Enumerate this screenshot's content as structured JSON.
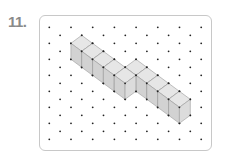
{
  "exercise": {
    "number_label": "11."
  },
  "diagram": {
    "type": "isometric-dot-paper",
    "grid": {
      "origin_x": 49.3,
      "origin_y": 27.3,
      "col_spacing": 10.85,
      "row_spacing": 16,
      "columns": 15,
      "rows": 8
    },
    "cube": {
      "edge_dx": 10.85,
      "edge_dy": 8,
      "height": 16
    },
    "segments": [
      {
        "name": "lower-row",
        "count": 5,
        "start_top": [
          81.7,
          35.3
        ]
      },
      {
        "name": "upper-row",
        "count": 5,
        "start_top": [
          136,
          59.3
        ]
      }
    ],
    "colors": {
      "top": "#e6e6e6",
      "left": "#d2d2d2",
      "right": "#dcdcdc",
      "edge": "#9a9a9a",
      "dot": "#222222",
      "border": "#c8c8c8",
      "number": "#8a8a8a"
    }
  }
}
